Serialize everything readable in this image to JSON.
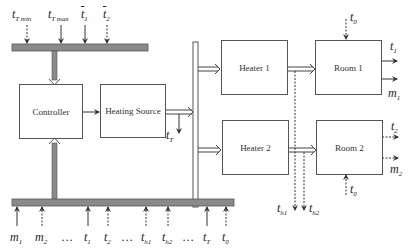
{
  "diagram": {
    "type": "block-diagram",
    "blocks": {
      "controller": "Controller",
      "heating_source": "Heating Source",
      "heater1": "Heater 1",
      "heater2": "Heater 2",
      "room1": "Room 1",
      "room2": "Room 2"
    },
    "top_inputs": [
      {
        "sym": "t",
        "sub": "T min",
        "overline": false,
        "style": "dashed"
      },
      {
        "sym": "t",
        "sub": "T max",
        "overline": false,
        "style": "solid"
      },
      {
        "sym": "t",
        "sub": "1",
        "overline": true,
        "style": "solid"
      },
      {
        "sym": "t",
        "sub": "2",
        "overline": true,
        "style": "dashed"
      }
    ],
    "heating_source_output": {
      "sym": "t",
      "sub": "T"
    },
    "heater_outputs": [
      {
        "sym": "t",
        "sub": "h1"
      },
      {
        "sym": "t",
        "sub": "h2"
      }
    ],
    "room1": {
      "input": {
        "sym": "t",
        "sub": "0"
      },
      "outputs": [
        {
          "sym": "t",
          "sub": "1"
        },
        {
          "sym": "m",
          "sub": "1"
        }
      ]
    },
    "room2": {
      "input": {
        "sym": "t",
        "sub": "0"
      },
      "outputs": [
        {
          "sym": "t",
          "sub": "2"
        },
        {
          "sym": "m",
          "sub": "2"
        }
      ]
    },
    "bottom_inputs": [
      {
        "sym": "m",
        "sub": "1",
        "style": "solid"
      },
      {
        "sym": "m",
        "sub": "2",
        "style": "dashed"
      },
      {
        "sym": "…",
        "sub": ""
      },
      {
        "sym": "t",
        "sub": "1",
        "style": "solid"
      },
      {
        "sym": "t",
        "sub": "2",
        "style": "dashed"
      },
      {
        "sym": "…",
        "sub": ""
      },
      {
        "sym": "t",
        "sub": "h1",
        "style": "dashed"
      },
      {
        "sym": "t",
        "sub": "h2",
        "style": "dashed"
      },
      {
        "sym": "…",
        "sub": ""
      },
      {
        "sym": "t",
        "sub": "T",
        "style": "solid"
      },
      {
        "sym": "t",
        "sub": "0",
        "style": "dashed"
      }
    ],
    "colors": {
      "bar": "#8a8a8a",
      "bar_border": "#555555",
      "line": "#333333"
    }
  }
}
